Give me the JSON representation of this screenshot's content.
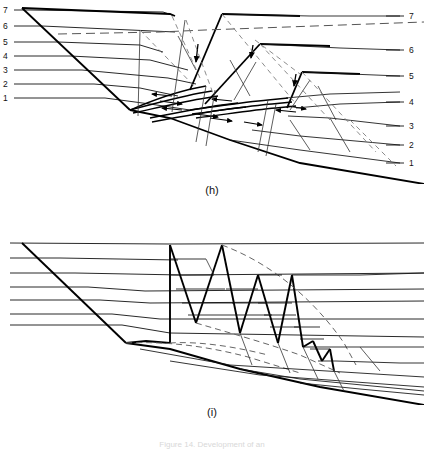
{
  "figure": {
    "panels": [
      {
        "id": "h",
        "caption": "(h)",
        "left_labels": [
          "7",
          "6",
          "5",
          "4",
          "3",
          "2",
          "1"
        ],
        "right_labels": [
          "7",
          "6",
          "5",
          "4",
          "3",
          "2",
          "1"
        ]
      },
      {
        "id": "i",
        "caption": "(i)",
        "left_labels": [],
        "right_labels": []
      }
    ],
    "figcaption": "Figure 14. Development of an",
    "colors": {
      "line": "#111111",
      "thick_line": "#000000",
      "dashed_line": "#555555",
      "background": "#ffffff"
    }
  }
}
